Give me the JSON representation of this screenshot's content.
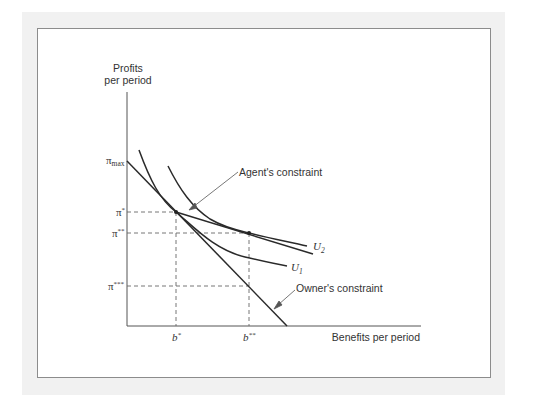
{
  "figure": {
    "y_axis_label_line1": "Profits",
    "y_axis_label_line2": "per period",
    "x_axis_label": "Benefits per period",
    "y_ticks": [
      {
        "label": "π",
        "sub": "max",
        "sup": ""
      },
      {
        "label": "π",
        "sub": "",
        "sup": "*"
      },
      {
        "label": "π",
        "sub": "",
        "sup": "**"
      },
      {
        "label": "π",
        "sub": "",
        "sup": "***"
      }
    ],
    "x_ticks": [
      {
        "label": "b",
        "sup": "*"
      },
      {
        "label": "b",
        "sup": "**"
      }
    ],
    "annotations": {
      "agent": "Agent's constraint",
      "owner": "Owner's constraint",
      "u1": "U",
      "u1_sub": "1",
      "u2": "U",
      "u2_sub": "2"
    },
    "colors": {
      "line": "#2a2a2a",
      "dashed": "#555555",
      "frame_border": "#8c8c8c",
      "band": "#f1f1f1"
    }
  }
}
